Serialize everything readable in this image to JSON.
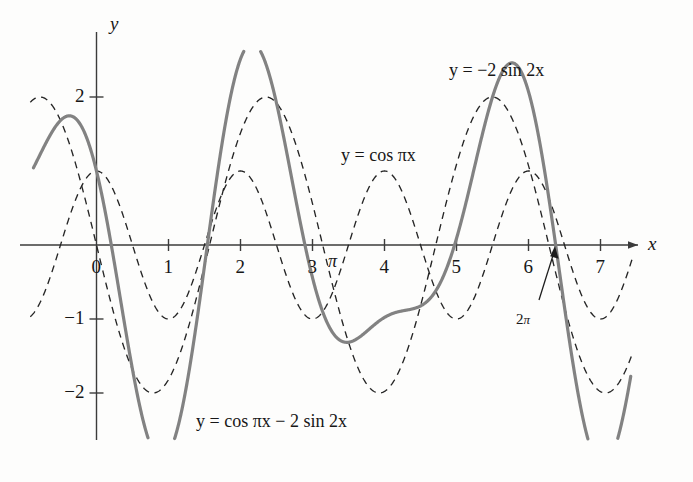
{
  "figure": {
    "background_color": "#fdfdfc",
    "axis_color": "#3b3b3b",
    "solid_curve_color": "#828282",
    "dashed_curve_color": "#252525"
  },
  "axes": {
    "x_axis_name": "x",
    "y_axis_name": "y",
    "x_ticks": [
      {
        "label": "0",
        "value": 0
      },
      {
        "label": "1",
        "value": 1
      },
      {
        "label": "2",
        "value": 2
      },
      {
        "label": "3",
        "value": 3
      },
      {
        "label": "4",
        "value": 4
      },
      {
        "label": "5",
        "value": 5
      },
      {
        "label": "6",
        "value": 6
      },
      {
        "label": "7",
        "value": 7
      }
    ],
    "y_ticks": [
      {
        "label": "2",
        "value": 2
      },
      {
        "label": "−1",
        "value": -1
      },
      {
        "label": "−2",
        "value": -2
      }
    ]
  },
  "annotations": [
    {
      "name": "pi-marker",
      "label": "π",
      "x_value": 3.14159
    },
    {
      "name": "two-pi-marker",
      "label_prefix": "2",
      "label_pi": "π",
      "x_value": 6.28319
    }
  ],
  "curve_labels": {
    "minus_two_sin": "y = −2 sin 2x",
    "cos_pix": "y = cos πx",
    "sum": "y = cos πx − 2 sin 2x"
  },
  "chart_data": {
    "type": "line",
    "title": "",
    "xlabel": "x",
    "ylabel": "y",
    "xlim": [
      -0.9,
      7.45
    ],
    "ylim": [
      -2.6,
      2.6
    ],
    "grid": false,
    "legend": "inline-annotations",
    "x_ticks": [
      0,
      1,
      2,
      3,
      4,
      5,
      6,
      7
    ],
    "y_ticks": [
      2,
      -1,
      -2
    ],
    "series": [
      {
        "name": "y = cos πx",
        "style": "dashed",
        "color": "#252525",
        "formula": "cos(pi*x)",
        "amplitude": 1,
        "period": 2,
        "key_points": [
          {
            "x": 0,
            "y": 1
          },
          {
            "x": 0.5,
            "y": 0
          },
          {
            "x": 1,
            "y": -1
          },
          {
            "x": 1.5,
            "y": 0
          },
          {
            "x": 2,
            "y": 1
          },
          {
            "x": 3,
            "y": -1
          },
          {
            "x": 4,
            "y": 1
          },
          {
            "x": 5,
            "y": -1
          },
          {
            "x": 6,
            "y": 1
          },
          {
            "x": 7,
            "y": -1
          }
        ]
      },
      {
        "name": "y = −2 sin 2x",
        "style": "dashed",
        "color": "#252525",
        "formula": "-2*sin(2*x)",
        "amplitude": 2,
        "period": 3.14159,
        "key_points": [
          {
            "x": 0,
            "y": 0
          },
          {
            "x": 0.785,
            "y": -2
          },
          {
            "x": 1.571,
            "y": 0
          },
          {
            "x": 2.356,
            "y": 2
          },
          {
            "x": 3.142,
            "y": 0
          },
          {
            "x": 3.927,
            "y": -2
          },
          {
            "x": 4.712,
            "y": 0
          },
          {
            "x": 5.498,
            "y": 2
          },
          {
            "x": 6.283,
            "y": 0
          },
          {
            "x": 7.069,
            "y": -2
          }
        ]
      },
      {
        "name": "y = cos πx − 2 sin 2x",
        "style": "solid",
        "color": "#828282",
        "formula": "cos(pi*x) - 2*sin(2*x)",
        "key_points": [
          {
            "x": -0.87,
            "y": 2.04
          },
          {
            "x": 0,
            "y": 1.0
          },
          {
            "x": 0.9,
            "y": -2.46
          },
          {
            "x": 2.38,
            "y": 2.42
          },
          {
            "x": 3.95,
            "y": -1.77
          },
          {
            "x": 4.45,
            "y": -1.22
          },
          {
            "x": 5.0,
            "y": -1.76
          },
          {
            "x": 5.95,
            "y": 2.2
          },
          {
            "x": 7.2,
            "y": -2.43
          }
        ]
      }
    ]
  }
}
